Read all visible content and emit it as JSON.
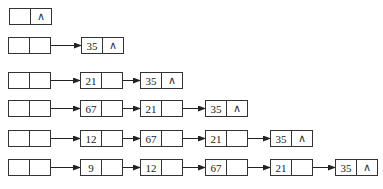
{
  "diagram": {
    "type": "linked-list-insertion-steps",
    "null_symbol": "∧",
    "rows": [
      {
        "y": 8,
        "head_x": 9,
        "nodes": []
      },
      {
        "y": 37,
        "head_x": 8,
        "nodes": [
          {
            "value": "35",
            "x": 81
          }
        ]
      },
      {
        "y": 72,
        "head_x": 8,
        "nodes": [
          {
            "value": "21",
            "x": 80
          },
          {
            "value": "35",
            "x": 140
          }
        ]
      },
      {
        "y": 100,
        "head_x": 8,
        "nodes": [
          {
            "value": "67",
            "x": 80
          },
          {
            "value": "21",
            "x": 140
          },
          {
            "value": "35",
            "x": 205
          }
        ]
      },
      {
        "y": 130,
        "head_x": 8,
        "nodes": [
          {
            "value": "12",
            "x": 80
          },
          {
            "value": "67",
            "x": 140
          },
          {
            "value": "21",
            "x": 205
          },
          {
            "value": "35",
            "x": 270
          }
        ]
      },
      {
        "y": 159,
        "head_x": 8,
        "nodes": [
          {
            "value": "9",
            "x": 80
          },
          {
            "value": "12",
            "x": 140
          },
          {
            "value": "67",
            "x": 205
          },
          {
            "value": "21",
            "x": 270
          },
          {
            "value": "35",
            "x": 335
          }
        ]
      }
    ]
  }
}
